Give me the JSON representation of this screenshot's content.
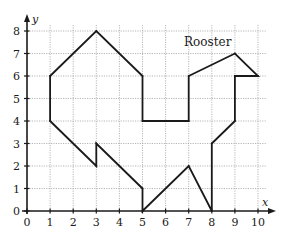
{
  "chart_data": {
    "type": "line",
    "title": "Rooster",
    "xlabel": "x",
    "ylabel": "y",
    "xlim": [
      0,
      10
    ],
    "ylim": [
      0,
      8
    ],
    "x_ticks": [
      "0",
      "1",
      "2",
      "3",
      "4",
      "5",
      "6",
      "7",
      "8",
      "9",
      "10"
    ],
    "y_ticks": [
      "0",
      "1",
      "2",
      "3",
      "4",
      "5",
      "6",
      "7",
      "8"
    ],
    "grid": true,
    "legend": "none",
    "series": [
      {
        "name": "Rooster outline",
        "closed": true,
        "points": [
          [
            1,
            6
          ],
          [
            3,
            8
          ],
          [
            5,
            6
          ],
          [
            5,
            4
          ],
          [
            7,
            4
          ],
          [
            7,
            6
          ],
          [
            9,
            7
          ],
          [
            10,
            6
          ],
          [
            9,
            6
          ],
          [
            9,
            4
          ],
          [
            8,
            3
          ],
          [
            8,
            0
          ],
          [
            7,
            2
          ],
          [
            5,
            0
          ],
          [
            5,
            1
          ],
          [
            3,
            3
          ],
          [
            3,
            2
          ],
          [
            1,
            4
          ]
        ]
      }
    ]
  }
}
